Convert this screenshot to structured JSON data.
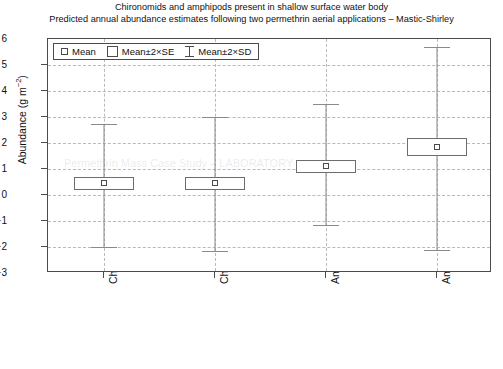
{
  "titles": {
    "line1": "Chironomids and amphipods present in shallow surface water body",
    "line2": "Predicted annual abundance estimates following two permethrin aerial applications – Mastic-Shirley"
  },
  "legend": {
    "position": "top-left-inside",
    "entries": [
      {
        "key": "mean",
        "label": "Mean",
        "glyph": "small-square"
      },
      {
        "key": "se",
        "label": "Mean±2×SE",
        "glyph": "open-box"
      },
      {
        "key": "sd",
        "label": "Mean±2×SD",
        "glyph": "whisker-bar"
      }
    ]
  },
  "axes": {
    "y": {
      "label_text": "Abundance (g m",
      "label_sup": "−2",
      "label_tail": ")",
      "ticks": [
        "6",
        "5",
        "4",
        "3",
        "2",
        "1",
        "0",
        "−1",
        "−2",
        "−3"
      ],
      "min": -3,
      "max": 6,
      "grid": true
    },
    "x": {
      "ticks": [
        "Chironomid (P)",
        "Chironomid (C)",
        "Amphipod (P)",
        "Amphipod (C)"
      ],
      "grid": true
    }
  },
  "colors": {
    "frame": "#4b4b4b",
    "grid": "#b9b9b9",
    "marker_edge": "#4b4b4b",
    "box_edge": "#6d6d6d",
    "whisker": "#8a8a8a",
    "background": "#ffffff"
  },
  "ghosts": {
    "g1": "Permethrin Mass Case Study – LABORATORY"
  },
  "chart_data": {
    "type": "scatter",
    "subtype": "mean-error-bar-plot",
    "title": "Chironomids and amphipods present in shallow surface water body",
    "subtitle": "Predicted annual abundance estimates following two permethrin aerial applications – Mastic-Shirley",
    "xlabel": "",
    "ylabel": "Abundance (g m−2)",
    "ylim": [
      -3,
      6
    ],
    "ytick_values": [
      6,
      5,
      4,
      3,
      2,
      1,
      0,
      -1,
      -2,
      -3
    ],
    "grid": true,
    "legend": [
      "Mean",
      "Mean±2×SE",
      "Mean±2×SD"
    ],
    "categories": [
      "Chironomid (P)",
      "Chironomid (C)",
      "Amphipod (P)",
      "Amphipod (C)"
    ],
    "series": [
      {
        "name": "Mean",
        "values": [
          0.45,
          0.45,
          1.1,
          1.85
        ]
      },
      {
        "name": "Mean±2×SE",
        "lower": [
          0.2,
          0.2,
          0.85,
          1.5
        ],
        "upper": [
          0.7,
          0.7,
          1.35,
          2.2
        ]
      },
      {
        "name": "Mean±2×SD",
        "lower": [
          -2.0,
          -2.15,
          -1.15,
          -2.1
        ],
        "upper": [
          2.75,
          3.0,
          3.5,
          5.7
        ]
      }
    ],
    "points": [
      {
        "category": "Chironomid (P)",
        "mean": 0.45,
        "se_lower": 0.2,
        "se_upper": 0.7,
        "sd_lower": -2.0,
        "sd_upper": 2.75
      },
      {
        "category": "Chironomid (C)",
        "mean": 0.45,
        "se_lower": 0.2,
        "se_upper": 0.7,
        "sd_lower": -2.15,
        "sd_upper": 3.0
      },
      {
        "category": "Amphipod (P)",
        "mean": 1.1,
        "se_lower": 0.85,
        "se_upper": 1.35,
        "sd_lower": -1.15,
        "sd_upper": 3.5
      },
      {
        "category": "Amphipod (C)",
        "mean": 1.85,
        "se_lower": 1.5,
        "se_upper": 2.2,
        "sd_lower": -2.1,
        "sd_upper": 5.7
      }
    ]
  }
}
